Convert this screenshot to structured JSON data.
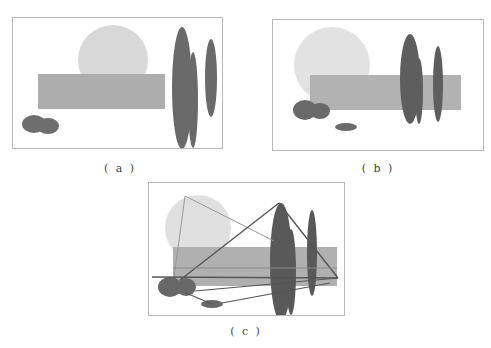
{
  "figure": {
    "panels": [
      {
        "id": "a",
        "caption": "( a )",
        "frame": {
          "x": 12,
          "y": 17,
          "w": 210,
          "h": 131
        },
        "caption_pos": {
          "x": 100,
          "y": 162
        },
        "shapes": [
          {
            "type": "circle",
            "name": "light-circle",
            "cx": 113,
            "cy": 60,
            "r": 35,
            "fill": "#d8d8d8"
          },
          {
            "type": "rect",
            "name": "medium-rectangle",
            "x": 38,
            "y": 74,
            "w": 127,
            "h": 35,
            "fill": "#adadad"
          },
          {
            "type": "ellipse",
            "name": "dark-ellipse-tall",
            "cx": 182,
            "cy": 88,
            "rx": 10,
            "ry": 61,
            "fill": "#6a6a6a"
          },
          {
            "type": "ellipse",
            "name": "dark-ellipse-short",
            "cx": 193,
            "cy": 100,
            "rx": 5,
            "ry": 48,
            "fill": "#6a6a6a"
          },
          {
            "type": "ellipse",
            "name": "dark-ellipse-right",
            "cx": 211,
            "cy": 78,
            "rx": 6,
            "ry": 39,
            "fill": "#6a6a6a"
          },
          {
            "type": "ellipse",
            "name": "dark-blob-left",
            "cx": 34,
            "cy": 124,
            "rx": 12,
            "ry": 9,
            "fill": "#6e6e6e"
          },
          {
            "type": "ellipse",
            "name": "dark-blob-right",
            "cx": 48,
            "cy": 126,
            "rx": 11,
            "ry": 8,
            "fill": "#6e6e6e"
          }
        ],
        "lines": []
      },
      {
        "id": "b",
        "caption": "( b )",
        "frame": {
          "x": 272,
          "y": 19,
          "w": 211,
          "h": 131
        },
        "caption_pos": {
          "x": 360,
          "y": 162
        },
        "shapes": [
          {
            "type": "circle",
            "name": "light-circle",
            "cx": 332,
            "cy": 65,
            "r": 38,
            "fill": "#e2e2e2"
          },
          {
            "type": "rect",
            "name": "medium-rectangle",
            "x": 310,
            "y": 75,
            "w": 151,
            "h": 35,
            "fill": "#b2b2b2"
          },
          {
            "type": "ellipse",
            "name": "dark-ellipse-tall",
            "cx": 410,
            "cy": 79,
            "rx": 10,
            "ry": 45,
            "fill": "#5e5e5e"
          },
          {
            "type": "ellipse",
            "name": "dark-ellipse-short",
            "cx": 419,
            "cy": 91,
            "rx": 4,
            "ry": 33,
            "fill": "#5e5e5e"
          },
          {
            "type": "ellipse",
            "name": "dark-ellipse-right",
            "cx": 438,
            "cy": 84,
            "rx": 5,
            "ry": 38,
            "fill": "#5e5e5e"
          },
          {
            "type": "ellipse",
            "name": "dark-blob-left",
            "cx": 305,
            "cy": 110,
            "rx": 12,
            "ry": 10,
            "fill": "#6a6a6a"
          },
          {
            "type": "ellipse",
            "name": "dark-blob-right",
            "cx": 320,
            "cy": 111,
            "rx": 10,
            "ry": 8,
            "fill": "#6a6a6a"
          },
          {
            "type": "ellipse",
            "name": "small-flat-ellipse",
            "cx": 346,
            "cy": 127,
            "rx": 11,
            "ry": 4,
            "fill": "#6a6a6a"
          }
        ],
        "lines": []
      },
      {
        "id": "c",
        "caption": "( c )",
        "frame": {
          "x": 148,
          "y": 182,
          "w": 196,
          "h": 133
        },
        "caption_pos": {
          "x": 235,
          "y": 325
        },
        "shapes": [
          {
            "type": "circle",
            "name": "light-circle",
            "cx": 198,
            "cy": 228,
            "r": 33,
            "fill": "#e0e0e0"
          },
          {
            "type": "rect",
            "name": "medium-rectangle",
            "x": 173,
            "y": 247,
            "w": 164,
            "h": 39,
            "fill": "#b0b0b0"
          },
          {
            "type": "ellipse",
            "name": "dark-ellipse-tall",
            "cx": 281,
            "cy": 262,
            "rx": 11,
            "ry": 59,
            "fill": "#595959"
          },
          {
            "type": "ellipse",
            "name": "dark-ellipse-short",
            "cx": 291,
            "cy": 272,
            "rx": 5,
            "ry": 43,
            "fill": "#595959"
          },
          {
            "type": "ellipse",
            "name": "dark-ellipse-right",
            "cx": 312,
            "cy": 253,
            "rx": 5,
            "ry": 43,
            "fill": "#595959"
          },
          {
            "type": "ellipse",
            "name": "dark-blob-left",
            "cx": 170,
            "cy": 287,
            "rx": 12,
            "ry": 10,
            "fill": "#686868"
          },
          {
            "type": "ellipse",
            "name": "dark-blob-right",
            "cx": 186,
            "cy": 287,
            "rx": 10,
            "ry": 9,
            "fill": "#686868"
          },
          {
            "type": "ellipse",
            "name": "small-flat-ellipse",
            "cx": 212,
            "cy": 304,
            "rx": 11,
            "ry": 4,
            "fill": "#686868"
          }
        ],
        "lines": [
          {
            "name": "light-triangle-edge-1",
            "x1": 185,
            "y1": 196,
            "x2": 174,
            "y2": 278,
            "stroke": "#999999",
            "w": 1
          },
          {
            "name": "light-triangle-edge-2",
            "x1": 185,
            "y1": 196,
            "x2": 274,
            "y2": 241,
            "stroke": "#999999",
            "w": 1
          },
          {
            "name": "dark-triangle-edge-1",
            "x1": 279,
            "y1": 203,
            "x2": 180,
            "y2": 280,
            "stroke": "#555555",
            "w": 1.4
          },
          {
            "name": "dark-triangle-edge-2",
            "x1": 279,
            "y1": 203,
            "x2": 338,
            "y2": 278,
            "stroke": "#555555",
            "w": 1.4
          },
          {
            "name": "horizontal-line-1",
            "x1": 152,
            "y1": 277,
            "x2": 338,
            "y2": 278,
            "stroke": "#555555",
            "w": 1.4
          },
          {
            "name": "horizontal-line-2",
            "x1": 173,
            "y1": 268,
            "x2": 337,
            "y2": 268,
            "stroke": "#888888",
            "w": 1
          },
          {
            "name": "converging-line-1",
            "x1": 195,
            "y1": 291,
            "x2": 338,
            "y2": 278,
            "stroke": "#555555",
            "w": 1.2
          },
          {
            "name": "converging-line-2",
            "x1": 186,
            "y1": 293,
            "x2": 212,
            "y2": 304,
            "stroke": "#555555",
            "w": 1.2
          },
          {
            "name": "converging-line-3",
            "x1": 222,
            "y1": 303,
            "x2": 330,
            "y2": 283,
            "stroke": "#555555",
            "w": 1.2
          }
        ]
      }
    ],
    "frame_color": "#b8b8b8",
    "caption_color": "#444444"
  }
}
